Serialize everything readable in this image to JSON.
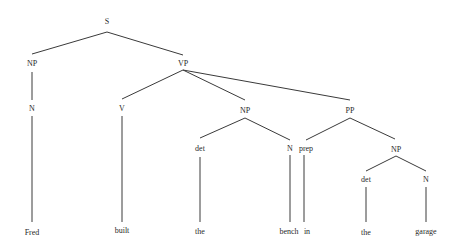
{
  "diagram": {
    "type": "parse-tree",
    "nodes": {
      "s": {
        "label": "S"
      },
      "np_subj": {
        "label": "NP"
      },
      "vp": {
        "label": "VP"
      },
      "n_subj": {
        "label": "N"
      },
      "v": {
        "label": "V"
      },
      "np_obj": {
        "label": "NP"
      },
      "pp": {
        "label": "PP"
      },
      "det_obj": {
        "label": "det"
      },
      "n_obj": {
        "label": "N"
      },
      "prep": {
        "label": "prep"
      },
      "np_pp": {
        "label": "NP"
      },
      "det_pp": {
        "label": "det"
      },
      "n_pp": {
        "label": "N"
      }
    },
    "leaves": {
      "fred": "Fred",
      "built": "built",
      "the1": "the",
      "bench": "bench",
      "in": "in",
      "the2": "the",
      "garage": "garage"
    }
  }
}
